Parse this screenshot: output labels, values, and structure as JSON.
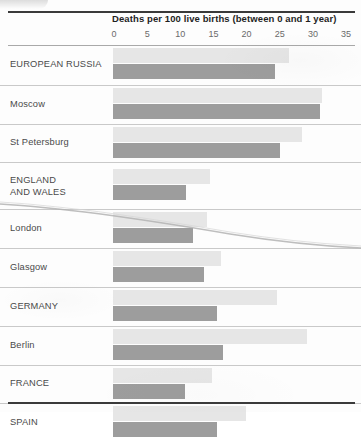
{
  "chart_data": {
    "type": "bar",
    "orientation": "horizontal",
    "title": "Deaths per 100 live births (between 0 and 1 year)",
    "xlabel": "Deaths per 100 live births (between 0 and 1 year)",
    "ylabel": "",
    "xlim": [
      0,
      35
    ],
    "xticks": [
      0,
      5,
      10,
      15,
      20,
      25,
      30,
      35
    ],
    "grid": false,
    "legend": "none",
    "categories": [
      "EUROPEAN RUSSIA",
      "Moscow",
      "St Petersburg",
      "ENGLAND\nAND WALES",
      "London",
      "Glasgow",
      "GERMANY",
      "Berlin",
      "FRANCE",
      "SPAIN"
    ],
    "series": [
      {
        "name": "light-bar",
        "color": "#e6e6e6",
        "values": [
          26.5,
          31.5,
          28.5,
          14.6,
          14.2,
          16.3,
          24.7,
          29.2,
          14.9,
          20.1
        ]
      },
      {
        "name": "dark-bar",
        "color": "#9d9d9d",
        "values": [
          24.4,
          31.2,
          25.2,
          11.0,
          12.1,
          13.7,
          15.7,
          16.6,
          10.9,
          15.7
        ]
      }
    ]
  },
  "axis": {
    "title": "Deaths per 100 live births (between 0 and 1 year)",
    "ticks": [
      "0",
      "5",
      "10",
      "15",
      "20",
      "25",
      "30",
      "35"
    ]
  },
  "rows": [
    {
      "label": "EUROPEAN RUSSIA",
      "light": 26.5,
      "dark": 24.4,
      "tall": false
    },
    {
      "label": "Moscow",
      "light": 31.5,
      "dark": 31.2,
      "tall": false
    },
    {
      "label": "St Petersburg",
      "light": 28.5,
      "dark": 25.2,
      "tall": false
    },
    {
      "label": "ENGLAND\nAND WALES",
      "light": 14.6,
      "dark": 11.0,
      "tall": true
    },
    {
      "label": "London",
      "light": 14.2,
      "dark": 12.1,
      "tall": false
    },
    {
      "label": "Glasgow",
      "light": 16.3,
      "dark": 13.7,
      "tall": false
    },
    {
      "label": "GERMANY",
      "light": 24.7,
      "dark": 15.7,
      "tall": false
    },
    {
      "label": "Berlin",
      "light": 29.2,
      "dark": 16.6,
      "tall": false
    },
    {
      "label": "FRANCE",
      "light": 14.9,
      "dark": 10.9,
      "tall": false
    },
    {
      "label": "SPAIN",
      "light": 20.1,
      "dark": 15.7,
      "tall": false
    }
  ],
  "colors": {
    "light_bar": "#e6e6e6",
    "dark_bar": "#9d9d9d",
    "rule": "#3a3a3a",
    "row_divider": "#c9c9c9",
    "text": "#4a4a4a"
  },
  "scale": {
    "x0_px": 113,
    "px_per_unit": 6.63
  }
}
